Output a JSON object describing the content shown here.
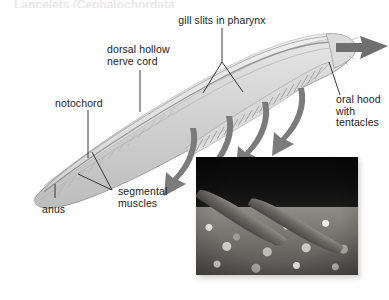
{
  "figure": {
    "subject": "lancelet",
    "cropped_heading_sliver": "Lancelets (Cephalochordata)",
    "background_color": "#fefefe",
    "label_color": "#1c1c1c",
    "arrow_color": "#7a7a7a",
    "body_color": "#c9c9c9"
  },
  "labels": [
    {
      "id": "gill-slits",
      "text": "gill slits in pharynx",
      "lines": [
        "gill slits in pharynx"
      ]
    },
    {
      "id": "nerve-cord",
      "text": "dorsal hollow nerve cord",
      "lines": [
        "dorsal hollow",
        "nerve cord"
      ]
    },
    {
      "id": "notochord",
      "text": "notochord",
      "lines": [
        "notochord"
      ]
    },
    {
      "id": "oral-hood",
      "text": "oral hood with tentacles",
      "lines": [
        "oral hood",
        "with",
        "tentacles"
      ]
    },
    {
      "id": "segmental",
      "text": "segmental muscles",
      "lines": [
        "segmental",
        "muscles"
      ]
    },
    {
      "id": "anus",
      "text": "anus",
      "lines": [
        "anus"
      ]
    }
  ],
  "label_text": {
    "gill_slits": "gill slits in pharynx",
    "nerve_cord_1": "dorsal hollow",
    "nerve_cord_2": "nerve cord",
    "notochord": "notochord",
    "oral_hood_1": "oral hood",
    "oral_hood_2": "with",
    "oral_hood_3": "tentacles",
    "segmental_1": "segmental",
    "segmental_2": "muscles",
    "anus": "anus"
  },
  "arrows": {
    "incoming": {
      "name": "water-intake-arrow",
      "direction": "left",
      "count": 1
    },
    "outgoing": {
      "name": "water-outflow-arrow",
      "direction": "down-left",
      "count": 4
    }
  },
  "photo": {
    "name": "lancelet-photograph",
    "caption": "",
    "subjects": 2,
    "description": "two lancelets partly buried in gravel"
  }
}
